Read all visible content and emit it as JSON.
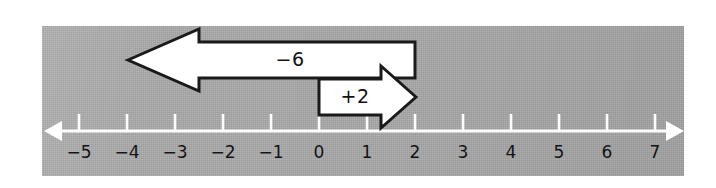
{
  "figure": {
    "kind": "number-line-arrow-diagram",
    "panel_background_color": "#a8a8a8",
    "axis_color": "#ffffff",
    "arrow_fill_color": "#ffffff",
    "arrow_stroke_color": "#1a1a1a",
    "label_color": "#141414"
  },
  "number_line": {
    "axis_y": 131,
    "left_arrow_tip_x": 44,
    "right_arrow_tip_x": 684,
    "unit_px": 48,
    "origin_x": 319,
    "tick_height": 17,
    "ticks": [
      {
        "value": -5,
        "label": "−5",
        "x": 79
      },
      {
        "value": -4,
        "label": "−4",
        "x": 127
      },
      {
        "value": -3,
        "label": "−3",
        "x": 175
      },
      {
        "value": -2,
        "label": "−2",
        "x": 223
      },
      {
        "value": -1,
        "label": "−1",
        "x": 271
      },
      {
        "value": 0,
        "label": "0",
        "x": 319
      },
      {
        "value": 1,
        "label": "1",
        "x": 367
      },
      {
        "value": 2,
        "label": "2",
        "x": 415
      },
      {
        "value": 3,
        "label": "3",
        "x": 463
      },
      {
        "value": 4,
        "label": "4",
        "x": 511
      },
      {
        "value": 5,
        "label": "5",
        "x": 559
      },
      {
        "value": 6,
        "label": "6",
        "x": 607
      },
      {
        "value": 7,
        "label": "7",
        "x": 655
      }
    ],
    "label_y": 158
  },
  "arrows": [
    {
      "name": "minus-six-arrow",
      "label": "−6",
      "magnitude": 6,
      "direction": "left",
      "start_value": 2,
      "end_value": -4,
      "start_x": 415,
      "tip_x": 128,
      "head_base_x": 199,
      "body_top_y": 42,
      "body_bottom_y": 78,
      "head_top_y": 29,
      "head_bottom_y": 91,
      "label_x": 290,
      "label_y": 66
    },
    {
      "name": "plus-two-arrow",
      "label": "+2",
      "magnitude": 2,
      "direction": "right",
      "start_value": 0,
      "end_value": 2,
      "start_x": 319,
      "tip_x": 416,
      "head_base_x": 381,
      "body_top_y": 79,
      "body_bottom_y": 115,
      "head_top_y": 66,
      "head_bottom_y": 128,
      "label_x": 355,
      "label_y": 103
    }
  ]
}
